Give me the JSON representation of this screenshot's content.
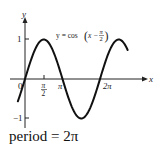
{
  "chart_data": {
    "type": "line",
    "title": "",
    "equation_label": "y = cos(x − π/2)",
    "xlabel": "x",
    "ylabel": "y",
    "x_ticks": [
      {
        "value": 0,
        "label": "0"
      },
      {
        "value": 1.5708,
        "label": "π/2"
      },
      {
        "value": 3.1416,
        "label": "π"
      },
      {
        "value": 6.2832,
        "label": "2π"
      }
    ],
    "y_ticks": [
      {
        "value": 1,
        "label": "1"
      },
      {
        "value": -1,
        "label": "−1"
      }
    ],
    "xlim": [
      -0.6,
      9.0
    ],
    "ylim": [
      -1.2,
      1.3
    ],
    "grid": false,
    "series": [
      {
        "name": "y = cos(x − π/2)",
        "x": [
          -0.6,
          0,
          0.785,
          1.571,
          2.356,
          3.142,
          3.927,
          4.712,
          5.498,
          6.283,
          7.069,
          7.854,
          8.6
        ],
        "values": [
          -0.56,
          0,
          0.71,
          1,
          0.71,
          0,
          -0.71,
          -1,
          -0.71,
          0,
          0.71,
          1,
          0.73
        ]
      }
    ]
  },
  "labels": {
    "x_axis": "x",
    "y_axis": "y",
    "origin": "0",
    "tick_pi_half_num": "π",
    "tick_pi_half_den": "2",
    "tick_pi": "π",
    "tick_two_pi": "2π",
    "tick_one": "1",
    "tick_neg_one": "−1",
    "equation_prefix": "y = cos",
    "equation_inner": "x −",
    "equation_frac_num": "π",
    "equation_frac_den": "2"
  },
  "caption": "period = 2π"
}
